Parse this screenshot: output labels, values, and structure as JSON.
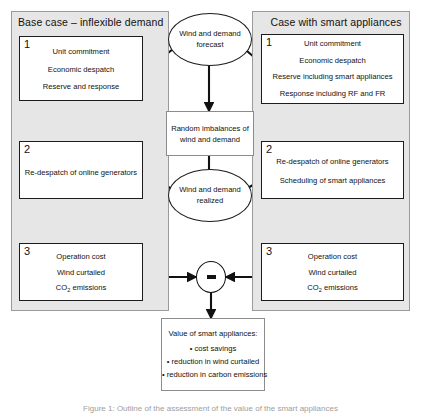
{
  "figure": {
    "caption": "Figure 1: Outline of the assessment of the value of the smart appliances"
  },
  "panels": {
    "left": {
      "title": "Base case – inflexible demand"
    },
    "right": {
      "title": "Case with smart appliances"
    }
  },
  "left_steps": [
    {
      "number": "1",
      "lines": [
        "Unit commitment",
        "Economic despatch",
        "Reserve and response"
      ]
    },
    {
      "number": "2",
      "lines": [
        "Re-despatch of online generators"
      ]
    },
    {
      "number": "3",
      "lines": [
        "Operation cost",
        "Wind curtailed",
        "CO2 emissions"
      ]
    }
  ],
  "right_steps": [
    {
      "number": "1",
      "lines": [
        "Unit commitment",
        "Economic despatch",
        "Reserve including smart appliances",
        "Response including RF and FR"
      ]
    },
    {
      "number": "2",
      "lines": [
        "Re-despatch of online generators",
        "Scheduling of smart appliances"
      ]
    },
    {
      "number": "3",
      "lines": [
        "Operation cost",
        "Wind curtailed",
        "CO2 emissions"
      ]
    }
  ],
  "center": {
    "forecast_ellipse": "Wind and demand forecast",
    "forecast_line1": "Wind and demand",
    "forecast_line2": "forecast",
    "imbalance_box_line1": "Random imbalances of",
    "imbalance_box_line2": "wind and demand",
    "realized_ellipse": "Wind and demand realized",
    "realized_line1": "Wind and demand",
    "realized_line2": "realized",
    "operator_symbol": "−",
    "operator_name": "minus"
  },
  "result_box": {
    "heading": "Value of smart appliances:",
    "bullets": [
      "• cost savings",
      "• reduction in wind curtailed",
      "• reduction in carbon emissions"
    ]
  },
  "colors": {
    "panel_fill": "#e6e6e6",
    "panel_border": "#9a9a9a",
    "box_border": "#1c1c1c",
    "line": "#111111",
    "page": "#ffffff"
  }
}
